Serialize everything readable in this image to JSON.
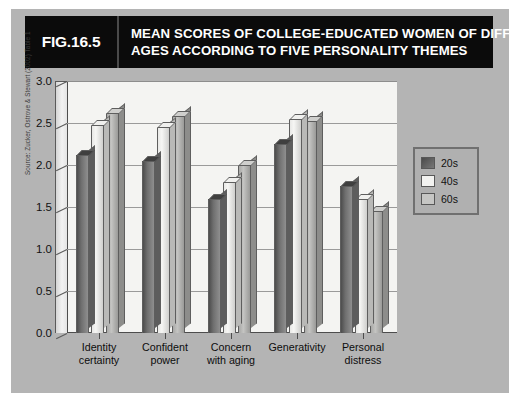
{
  "figure": {
    "number_label": "FIG.16.5",
    "title_line_1": "MEAN SCORES OF COLLEGE-EDUCATED WOMEN OF DIFFERENT",
    "title_line_2": "AGES ACCORDING TO FIVE PERSONALITY THEMES",
    "source_note": "Source: Zucker, Ostrove & Stewart (2002) Table 1",
    "header_background": "#0b0b0b",
    "header_text_color": "#ffffff",
    "panel_background": "#b4b4b4",
    "plot_background": "#f4f4f2"
  },
  "legend": {
    "position": "right",
    "entries": [
      {
        "label": "20s",
        "color": "#5a5a5a"
      },
      {
        "label": "40s",
        "color": "#f2f2f0"
      },
      {
        "label": "60s",
        "color": "#c6c6c4"
      }
    ]
  },
  "chart_data": {
    "type": "bar",
    "title": "MEAN SCORES OF COLLEGE-EDUCATED WOMEN OF DIFFERENT AGES ACCORDING TO FIVE PERSONALITY THEMES",
    "xlabel": "",
    "ylabel": "",
    "ylim": [
      0.0,
      3.0
    ],
    "ytick_labels": [
      "0.0",
      "0.5",
      "1.0",
      "1.5",
      "2.0",
      "2.5",
      "3.0"
    ],
    "ytick_values": [
      0.0,
      0.5,
      1.0,
      1.5,
      2.0,
      2.5,
      3.0
    ],
    "grid": true,
    "categories": [
      "Identity\ncertainty",
      "Confident\npower",
      "Concern\nwith aging",
      "Generativity",
      "Personal\ndistress"
    ],
    "category_lines": [
      [
        "Identity",
        "certainty"
      ],
      [
        "Confident",
        "power"
      ],
      [
        "Concern",
        "with aging"
      ],
      [
        "Generativity",
        ""
      ],
      [
        "Personal",
        "distress"
      ]
    ],
    "series": [
      {
        "name": "20s",
        "values": [
          2.12,
          2.05,
          1.6,
          2.25,
          1.75
        ]
      },
      {
        "name": "40s",
        "values": [
          2.48,
          2.45,
          1.8,
          2.55,
          1.6
        ]
      },
      {
        "name": "60s",
        "values": [
          2.62,
          2.58,
          2.0,
          2.52,
          1.45
        ]
      }
    ]
  }
}
